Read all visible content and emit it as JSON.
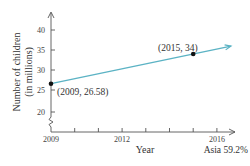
{
  "chart_data": {
    "type": "line",
    "title": "",
    "xlabel": "Year",
    "ylabel": "Number of children (in millions)",
    "ylabel_lines": [
      "Number of children",
      "(in millions)"
    ],
    "x_ticks": [
      2009,
      2010,
      2011,
      2012,
      2013,
      2014,
      2015,
      2016
    ],
    "x_tick_labels": [
      "2009",
      "2012",
      "2016"
    ],
    "x_labeled_ticks": [
      2009,
      2012,
      2016
    ],
    "y_ticks": [
      20,
      25,
      30,
      35,
      40
    ],
    "y_tick_labels": [
      "20",
      "25",
      "30",
      "35",
      "40"
    ],
    "xlim": [
      2009,
      2016.8
    ],
    "ylim": [
      20,
      43
    ],
    "y_axis_break": true,
    "grid": false,
    "legend": null,
    "series": [
      {
        "name": "Number of children",
        "color": "#5bb3c4",
        "x": [
          2009,
          2015
        ],
        "y": [
          26.58,
          34
        ],
        "extends_with_arrow": true
      }
    ],
    "points": [
      {
        "x": 2009,
        "y": 26.58,
        "label": "(2009, 26.58)"
      },
      {
        "x": 2015,
        "y": 34,
        "label": "(2015, 34)"
      }
    ],
    "annotations": [
      "(2009, 26.58)",
      "(2015, 34)"
    ]
  },
  "footer": {
    "text": "Asia 59.2%"
  },
  "colors": {
    "line": "#5bb3c4",
    "axis": "#555555",
    "point": "#111111",
    "text": "#333333"
  }
}
